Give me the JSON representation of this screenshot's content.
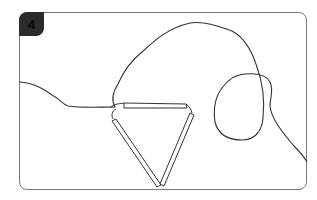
{
  "step": {
    "number": "4",
    "badge_color": "#2b2b2b"
  },
  "illustration": {
    "description": "Line drawing: a triangle made of three sticks with a wavy string line forming a loop",
    "line_color": "#333333",
    "frame_color": "#7a7a7a"
  }
}
